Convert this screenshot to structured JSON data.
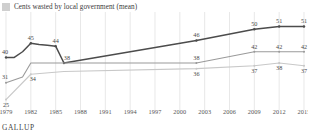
{
  "legend": {
    "swatch_icon": "legend-swatch-icon",
    "swatch_color": "#cfcfcf",
    "label": "Cents wasted by local government (mean)"
  },
  "footer": {
    "brand": "GALLUP"
  },
  "chart_data": {
    "type": "line",
    "title": "Cents wasted by local government (mean)",
    "xlabel": "",
    "ylabel": "",
    "grid": "vertical",
    "legend_position": "top-left",
    "xlim": [
      1979,
      2015
    ],
    "ylim": [
      22,
      54
    ],
    "x_ticks": [
      "1979",
      "1982",
      "1985",
      "1988",
      "1991",
      "1994",
      "1997",
      "2000",
      "2003",
      "2006",
      "2009",
      "2012",
      "2015"
    ],
    "series": [
      {
        "name": "Federal government",
        "color": "#4c4c4c",
        "points": [
          {
            "x": 1979,
            "y": 40,
            "label": "40"
          },
          {
            "x": 1980,
            "y": 40,
            "label": ""
          },
          {
            "x": 1981,
            "y": 42,
            "label": ""
          },
          {
            "x": 1982,
            "y": 45,
            "label": "45"
          },
          {
            "x": 1983,
            "y": 44.6,
            "label": ""
          },
          {
            "x": 1984,
            "y": 44.3,
            "label": ""
          },
          {
            "x": 1985,
            "y": 44,
            "label": "44"
          },
          {
            "x": 1986,
            "y": 38,
            "label": "38"
          },
          {
            "x": 2002,
            "y": 46,
            "label": "46"
          },
          {
            "x": 2009,
            "y": 50,
            "label": "50"
          },
          {
            "x": 2012,
            "y": 51,
            "label": "51"
          },
          {
            "x": 2015,
            "y": 51,
            "label": "51"
          }
        ]
      },
      {
        "name": "State government",
        "color": "#9a9a9a",
        "points": [
          {
            "x": 1979,
            "y": 31,
            "label": "31"
          },
          {
            "x": 1981,
            "y": 33,
            "label": ""
          },
          {
            "x": 1982,
            "y": 38,
            "label": ""
          },
          {
            "x": 1986,
            "y": 38,
            "label": ""
          },
          {
            "x": 2002,
            "y": 38,
            "label": "38"
          },
          {
            "x": 2009,
            "y": 42,
            "label": "42"
          },
          {
            "x": 2012,
            "y": 42,
            "label": "42"
          },
          {
            "x": 2015,
            "y": 42,
            "label": "42"
          }
        ]
      },
      {
        "name": "Local government",
        "color": "#c8c8c8",
        "points": [
          {
            "x": 1979,
            "y": 25,
            "label": "25"
          },
          {
            "x": 1982,
            "y": 34,
            "label": "34"
          },
          {
            "x": 1986,
            "y": 35,
            "label": ""
          },
          {
            "x": 2002,
            "y": 36,
            "label": "36"
          },
          {
            "x": 2009,
            "y": 37,
            "label": "37"
          },
          {
            "x": 2012,
            "y": 38,
            "label": "38"
          },
          {
            "x": 2015,
            "y": 37,
            "label": "37"
          }
        ]
      }
    ]
  }
}
